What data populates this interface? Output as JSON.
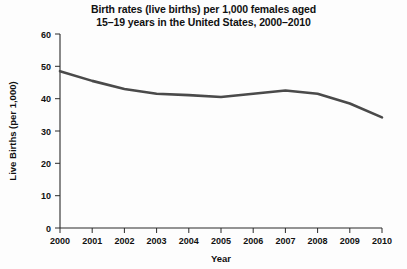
{
  "chart_data": {
    "type": "line",
    "title": "Birth rates (live births) per 1,000 females aged 15–19 years in the United States, 2000–2010",
    "title_lines": [
      "Birth rates (live births) per 1,000 females aged",
      "15–19 years in the United States, 2000–2010"
    ],
    "xlabel": "Year",
    "ylabel": "Live Births (per 1,000)",
    "categories": [
      "2000",
      "2001",
      "2002",
      "2003",
      "2004",
      "2005",
      "2006",
      "2007",
      "2008",
      "2009",
      "2010"
    ],
    "x": [
      2000,
      2001,
      2002,
      2003,
      2004,
      2005,
      2006,
      2007,
      2008,
      2009,
      2010
    ],
    "values": [
      48.5,
      45.5,
      43.0,
      41.5,
      41.1,
      40.5,
      41.5,
      42.5,
      41.5,
      38.5,
      34.2
    ],
    "series": [
      {
        "name": "Birth rate",
        "values": [
          48.5,
          45.5,
          43.0,
          41.5,
          41.1,
          40.5,
          41.5,
          42.5,
          41.5,
          38.5,
          34.2
        ],
        "color": "#4a4a4a"
      }
    ],
    "ylim": [
      0,
      60
    ],
    "xlim": [
      2000,
      2010
    ],
    "yticks": [
      0,
      10,
      20,
      30,
      40,
      50,
      60
    ],
    "ytick_labels": [
      "0",
      "10",
      "20",
      "30",
      "40",
      "50",
      "60"
    ],
    "xtick_labels": [
      "2000",
      "2001",
      "2002",
      "2003",
      "2004",
      "2005",
      "2006",
      "2007",
      "2008",
      "2009",
      "2010"
    ],
    "grid": false,
    "legend": null,
    "legend_position": "none",
    "annotations": [],
    "line_color": "#4a4a4a",
    "axis_color": "#2a2a2a",
    "background_color": "#fdfdfd"
  }
}
